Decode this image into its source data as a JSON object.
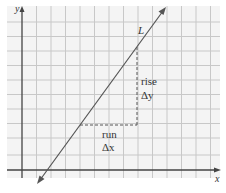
{
  "diagram": {
    "title": "",
    "axes": {
      "x_label": "x",
      "y_label": "y"
    },
    "line_label": "L",
    "rise_label": "rise",
    "rise_symbol": "Δy",
    "run_label": "run",
    "run_symbol": "Δx",
    "colors": {
      "grid": "#c8c8c8",
      "background": "#f4f4f4",
      "axis": "#444444",
      "line": "#555555"
    }
  }
}
